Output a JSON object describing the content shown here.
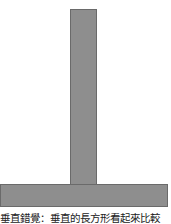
{
  "figure": {
    "shapes": [
      {
        "name": "vertical-rectangle",
        "orientation": "vertical",
        "fill": "#8e8e8e",
        "stroke": "#6a6a6a"
      },
      {
        "name": "horizontal-rectangle",
        "orientation": "horizontal",
        "fill": "#8e8e8e",
        "stroke": "#6a6a6a"
      }
    ],
    "caption": "垂直錯覺：垂直的長方形看起來比較"
  }
}
